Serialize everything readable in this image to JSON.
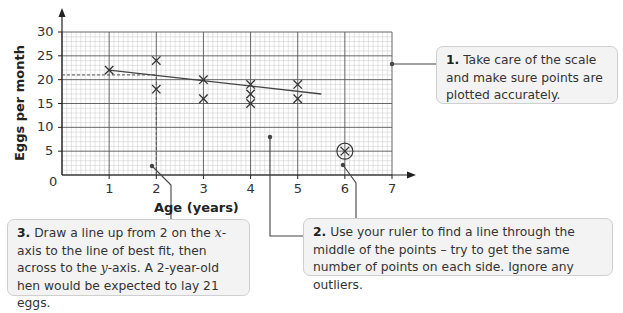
{
  "chart_data": {
    "type": "scatter",
    "title": "",
    "xlabel": "Age (years)",
    "ylabel": "Eggs per month",
    "xlim": [
      0,
      7
    ],
    "ylim": [
      0,
      30
    ],
    "x_ticks": [
      1,
      2,
      3,
      4,
      5,
      6,
      7
    ],
    "y_ticks": [
      0,
      5,
      10,
      15,
      20,
      25,
      30
    ],
    "grid": true,
    "points": [
      {
        "x": 1,
        "y": 22
      },
      {
        "x": 2,
        "y": 24
      },
      {
        "x": 2,
        "y": 18
      },
      {
        "x": 3,
        "y": 20
      },
      {
        "x": 3,
        "y": 16
      },
      {
        "x": 4,
        "y": 19
      },
      {
        "x": 4,
        "y": 17
      },
      {
        "x": 4,
        "y": 15
      },
      {
        "x": 5,
        "y": 19
      },
      {
        "x": 5,
        "y": 16
      },
      {
        "x": 6,
        "y": 5,
        "outlier": true
      }
    ],
    "line_of_best_fit": {
      "x1": 1,
      "y1": 22,
      "x2": 5.5,
      "y2": 17
    },
    "reading": {
      "x": 2,
      "y": 21
    },
    "annotations": [
      "1. Take care of the scale and make sure points are plotted accurately.",
      "2. Use your ruler to find a line through the middle of the points – try to get the same number of points on each side. Ignore any outliers.",
      "3. Draw a line up from 2 on the x-axis to the line of best fit, then across to the y-axis. A 2-year-old hen would be expected to lay 21 eggs."
    ]
  },
  "axes": {
    "x_title": "Age (years)",
    "y_title": "Eggs per month",
    "origin_label": "0",
    "x_tick_labels": [
      "1",
      "2",
      "3",
      "4",
      "5",
      "6",
      "7"
    ],
    "y_tick_labels": [
      "5",
      "10",
      "15",
      "20",
      "25",
      "30"
    ]
  },
  "callouts": {
    "c1": {
      "num": "1.",
      "text": " Take care of the scale and make sure points are plotted accurately."
    },
    "c2": {
      "num": "2.",
      "text": " Use your ruler to find a line through the middle of the points – try to get the same number of points on each side. Ignore any outliers."
    },
    "c3": {
      "num": "3.",
      "text_a": " Draw a line up from 2 on the ",
      "var_x": "x",
      "text_b": "-axis to the line of best fit, then across to the ",
      "var_y": "y",
      "text_c": "-axis. A 2-year-old hen would be expected to lay 21 eggs."
    }
  },
  "colors": {
    "grid_minor": "#c8c8c8",
    "grid_major": "#555555",
    "axis": "#222222",
    "marker": "#333333",
    "callout_bg": "#f3f3f3",
    "callout_border": "#cfcfcf"
  }
}
